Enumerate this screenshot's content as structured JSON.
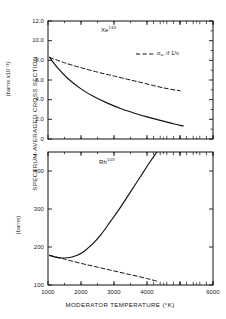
{
  "figure": {
    "axis_title_y": "SPECTRUM-AVERAGED CROSS SECTION",
    "axis_title_x": "MODERATOR TEMPERATURE (°K)",
    "unit_upper": "(barns x10⁻³)",
    "unit_lower": "(barns)"
  },
  "chart_data": [
    {
      "type": "line",
      "panel": "upper",
      "title": "Xe",
      "title_superscript": "135",
      "xlabel": "MODERATOR TEMPERATURE (°K)",
      "ylabel": "SPECTRUM-AVERAGED CROSS SECTION (barns x10⁻³)",
      "xlim": [
        1000,
        6000
      ],
      "ylim": [
        0,
        12.0
      ],
      "grid": false,
      "xticks": [
        1000,
        2000,
        3000,
        4000,
        5000,
        6000
      ],
      "xtick_labels": [
        "",
        "",
        "",
        "",
        "",
        ""
      ],
      "yticks": [
        0,
        2.0,
        4.0,
        6.0,
        8.0,
        10.0,
        12.0
      ],
      "ytick_labels": [
        "0",
        "2.0",
        "4.0",
        "6.0",
        "8.0",
        "10.0",
        "12.0"
      ],
      "series": [
        {
          "name": "Xe-135 spectrum-averaged cross section",
          "style": "solid",
          "x": [
            1050,
            1300,
            1600,
            2000,
            2400,
            2800,
            3200,
            3600,
            4000,
            4400,
            4800,
            5100
          ],
          "y": [
            8.3,
            7.2,
            6.15,
            5.1,
            4.3,
            3.65,
            3.1,
            2.65,
            2.25,
            1.9,
            1.55,
            1.32
          ]
        },
        {
          "name": "sigma_a, if 1/v",
          "style": "dashed",
          "x": [
            1050,
            1500,
            2000,
            2500,
            3000,
            3500,
            4000,
            4500,
            5000
          ],
          "y": [
            8.3,
            7.75,
            7.25,
            6.8,
            6.4,
            6.0,
            5.6,
            5.2,
            4.9
          ]
        }
      ],
      "legend": {
        "position": "upper-right",
        "entries": [
          {
            "label_prefix": "σ",
            "label_sub": "a",
            "label_rest": ", if 1/v",
            "style": "dashed"
          }
        ]
      }
    },
    {
      "type": "line",
      "panel": "lower",
      "title": "Rh",
      "title_superscript": "103",
      "xlabel": "MODERATOR TEMPERATURE (°K)",
      "ylabel": "SPECTRUM-AVERAGED CROSS SECTION (barns)",
      "xlim": [
        1000,
        6000
      ],
      "ylim": [
        100,
        450
      ],
      "grid": false,
      "xticks": [
        1000,
        2000,
        3000,
        4000,
        5000,
        6000
      ],
      "xtick_labels": [
        "1000",
        "2000",
        "3000",
        "4000",
        "",
        "6000"
      ],
      "yticks": [
        100,
        200,
        300,
        400
      ],
      "ytick_labels": [
        "100",
        "200",
        "300",
        "400"
      ],
      "series": [
        {
          "name": "Rh-103 spectrum-averaged cross section",
          "style": "solid",
          "x": [
            1050,
            1300,
            1500,
            1700,
            1900,
            2100,
            2350,
            2600,
            2900,
            3200,
            3500,
            3800,
            4100,
            4400,
            4600
          ],
          "y": [
            178,
            172,
            171,
            173,
            179,
            189,
            208,
            232,
            268,
            305,
            345,
            385,
            425,
            462,
            485
          ]
        },
        {
          "name": "sigma_a, if 1/v",
          "style": "dashed",
          "x": [
            1050,
            1500,
            2000,
            2500,
            3000,
            3500,
            4000,
            4300
          ],
          "y": [
            178,
            168,
            157,
            147,
            137,
            127,
            117,
            110
          ]
        }
      ]
    }
  ]
}
